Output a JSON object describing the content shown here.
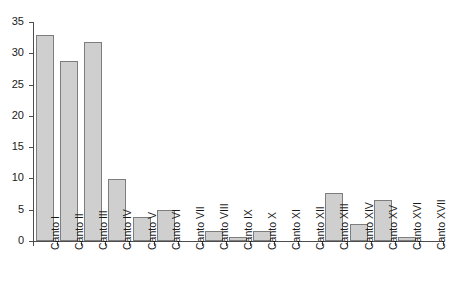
{
  "chart_data": {
    "type": "bar",
    "title": "",
    "subtitle": "",
    "xlabel": "",
    "ylabel": "",
    "ylim": [
      0,
      35
    ],
    "ytick_values": [
      0,
      5,
      10,
      15,
      20,
      25,
      30,
      35
    ],
    "ytick_labels": [
      "0",
      "5",
      "10",
      "15",
      "20",
      "25",
      "30",
      "35"
    ],
    "grid": false,
    "legend": null,
    "legend_position": "none",
    "bar_fill_color": "#cfcfcf",
    "bar_border_color": "#7d7d7d",
    "axis_color": "#4d4d4d",
    "background_color": "#ffffff",
    "categories": [
      "Canto I",
      "Canto II",
      "Canto III",
      "Canto IV",
      "Canto V",
      "Canto VI",
      "Canto VII",
      "Canto VIII",
      "Canto IX",
      "Canto X",
      "Canto XI",
      "Canto XII",
      "Canto XIII",
      "Canto XIV",
      "Canto XV",
      "Canto XVI",
      "Canto XVII"
    ],
    "values": [
      33,
      28.8,
      31.8,
      9.9,
      3.9,
      4.9,
      0,
      1.6,
      0.7,
      1.6,
      0,
      0,
      7.6,
      2.7,
      6.5,
      0.6,
      0
    ]
  }
}
